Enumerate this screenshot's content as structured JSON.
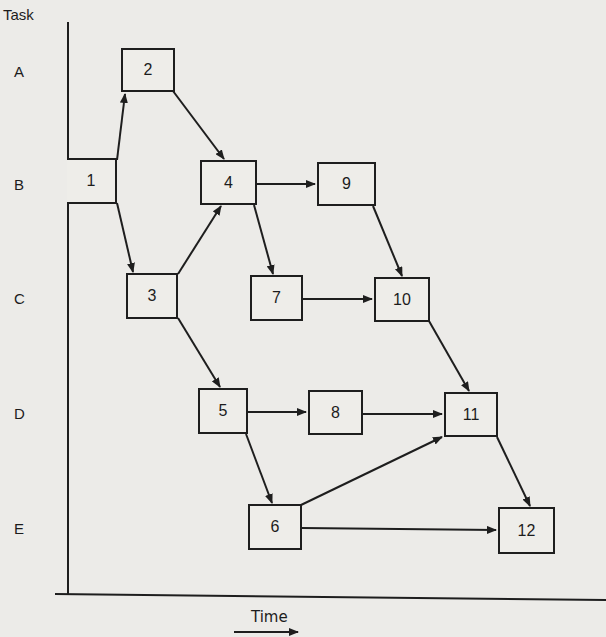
{
  "diagram": {
    "y_axis_title": "Task",
    "x_axis_title": "Time",
    "rows": [
      {
        "label": "A",
        "y": 58
      },
      {
        "label": "B",
        "y": 176
      },
      {
        "label": "C",
        "y": 290
      },
      {
        "label": "D",
        "y": 405
      },
      {
        "label": "E",
        "y": 521
      }
    ],
    "nodes": [
      {
        "id": "1",
        "label": "1",
        "row": "B",
        "x": 67,
        "y": 158,
        "w": 50,
        "h": 46
      },
      {
        "id": "2",
        "label": "2",
        "row": "A",
        "x": 121,
        "y": 48,
        "w": 54,
        "h": 44
      },
      {
        "id": "3",
        "label": "3",
        "row": "C",
        "x": 126,
        "y": 273,
        "w": 52,
        "h": 46
      },
      {
        "id": "4",
        "label": "4",
        "row": "B",
        "x": 200,
        "y": 160,
        "w": 57,
        "h": 45
      },
      {
        "id": "5",
        "label": "5",
        "row": "D",
        "x": 198,
        "y": 388,
        "w": 50,
        "h": 46
      },
      {
        "id": "6",
        "label": "6",
        "row": "E",
        "x": 248,
        "y": 504,
        "w": 54,
        "h": 46
      },
      {
        "id": "7",
        "label": "7",
        "row": "C",
        "x": 250,
        "y": 275,
        "w": 53,
        "h": 46
      },
      {
        "id": "8",
        "label": "8",
        "row": "D",
        "x": 308,
        "y": 390,
        "w": 55,
        "h": 45
      },
      {
        "id": "9",
        "label": "9",
        "row": "B",
        "x": 317,
        "y": 162,
        "w": 59,
        "h": 44
      },
      {
        "id": "10",
        "label": "10",
        "row": "C",
        "x": 374,
        "y": 277,
        "w": 56,
        "h": 45
      },
      {
        "id": "11",
        "label": "11",
        "row": "D",
        "x": 444,
        "y": 392,
        "w": 54,
        "h": 45
      },
      {
        "id": "12",
        "label": "12",
        "row": "E",
        "x": 498,
        "y": 507,
        "w": 57,
        "h": 47
      }
    ],
    "edges": [
      {
        "from": "1",
        "to": "2",
        "x1": 117,
        "y1": 160,
        "x2": 125,
        "y2": 94
      },
      {
        "from": "1",
        "to": "3",
        "x1": 117,
        "y1": 203,
        "x2": 133,
        "y2": 272
      },
      {
        "from": "2",
        "to": "4",
        "x1": 173,
        "y1": 91,
        "x2": 224,
        "y2": 159
      },
      {
        "from": "3",
        "to": "4",
        "x1": 178,
        "y1": 274,
        "x2": 221,
        "y2": 206
      },
      {
        "from": "3",
        "to": "5",
        "x1": 178,
        "y1": 318,
        "x2": 220,
        "y2": 387
      },
      {
        "from": "4",
        "to": "9",
        "x1": 257,
        "y1": 184,
        "x2": 315,
        "y2": 184
      },
      {
        "from": "4",
        "to": "7",
        "x1": 254,
        "y1": 205,
        "x2": 273,
        "y2": 274
      },
      {
        "from": "9",
        "to": "10",
        "x1": 373,
        "y1": 206,
        "x2": 402,
        "y2": 276
      },
      {
        "from": "7",
        "to": "10",
        "x1": 303,
        "y1": 299,
        "x2": 372,
        "y2": 299
      },
      {
        "from": "10",
        "to": "11",
        "x1": 429,
        "y1": 321,
        "x2": 469,
        "y2": 391
      },
      {
        "from": "5",
        "to": "8",
        "x1": 248,
        "y1": 412,
        "x2": 306,
        "y2": 412
      },
      {
        "from": "5",
        "to": "6",
        "x1": 246,
        "y1": 434,
        "x2": 272,
        "y2": 503
      },
      {
        "from": "8",
        "to": "11",
        "x1": 363,
        "y1": 414,
        "x2": 442,
        "y2": 414
      },
      {
        "from": "6",
        "to": "11",
        "x1": 301,
        "y1": 505,
        "x2": 442,
        "y2": 437
      },
      {
        "from": "11",
        "to": "12",
        "x1": 497,
        "y1": 437,
        "x2": 530,
        "y2": 506
      },
      {
        "from": "6",
        "to": "12",
        "x1": 302,
        "y1": 528,
        "x2": 496,
        "y2": 530
      }
    ]
  }
}
